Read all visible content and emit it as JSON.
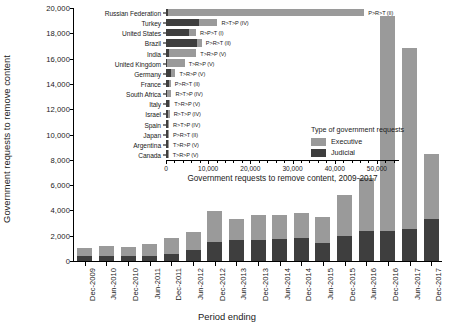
{
  "chart_data": [
    {
      "id": "main",
      "type": "bar",
      "stacked": true,
      "title": "",
      "xlabel": "Period ending",
      "ylabel": "Government requests to remove content",
      "ylim": [
        0,
        20000
      ],
      "ytick_values": [
        0,
        2000,
        4000,
        6000,
        8000,
        10000,
        12000,
        14000,
        16000,
        18000,
        20000
      ],
      "ytick_labels": [
        "0",
        "2,000",
        "4,000",
        "6,000",
        "8,000",
        "10,000",
        "12,000",
        "14,000",
        "16,000",
        "18,000",
        "20,000"
      ],
      "grid": false,
      "legend_position": "inset-center",
      "categories": [
        "Dec-2009",
        "Jun-2010",
        "Dec-2010",
        "Jun-2011",
        "Dec-2011",
        "Jun-2012",
        "Dec-2012",
        "Jun-2013",
        "Dec-2013",
        "Jun-2014",
        "Dec-2014",
        "Jun-2015",
        "Dec-2015",
        "Jun-2016",
        "Dec-2016",
        "Jun-2017",
        "Dec-2017"
      ],
      "series": [
        {
          "name": "Judicial",
          "color": "#3e3e3e",
          "values": [
            420,
            430,
            400,
            420,
            560,
            900,
            1500,
            1650,
            1700,
            1750,
            1800,
            1450,
            2000,
            2350,
            2400,
            2500,
            3300
          ]
        },
        {
          "name": "Executive",
          "color": "#9a9a9a",
          "values": [
            600,
            750,
            680,
            900,
            1250,
            1400,
            2450,
            1700,
            1900,
            1850,
            2000,
            2050,
            3250,
            4200,
            16950,
            14350,
            5200
          ]
        }
      ],
      "totals": [
        1020,
        1180,
        1080,
        1320,
        1810,
        2300,
        3950,
        3350,
        3600,
        3600,
        3800,
        3500,
        5250,
        6550,
        19350,
        16850,
        8500
      ]
    },
    {
      "id": "inset",
      "type": "bar",
      "orientation": "horizontal",
      "stacked": true,
      "title": "",
      "xlabel": "Government requests to remove content, 2009-2017",
      "ylabel": "",
      "xlim": [
        0,
        55000
      ],
      "xtick_values": [
        0,
        10000,
        20000,
        30000,
        40000,
        50000
      ],
      "xtick_labels": [
        "0",
        "10,000",
        "20,000",
        "30,000",
        "40,000",
        "50,000"
      ],
      "grid": false,
      "categories": [
        "Russian Federation",
        "Turkey",
        "United States",
        "Brazil",
        "India",
        "United Kingdom",
        "Germany",
        "France",
        "South Africa",
        "Italy",
        "Israel",
        "Spain",
        "Japan",
        "Argentina",
        "Canada"
      ],
      "annotations": [
        "P>R>T (II)",
        "R>T>P (IV)",
        "R>P>T (I)",
        "P>R>T (II)",
        "T>R>P (V)",
        "T>R>P (V)",
        "T>R>P (V)",
        "P>R>T (II)",
        "R>T>P (IV)",
        "T>R>P (V)",
        "R>T>P (IV)",
        "R>T>P (IV)",
        "P>R>T (II)",
        "T>R>P (V)",
        "T>R>P (V)"
      ],
      "series": [
        {
          "name": "Judicial",
          "color": "#3e3e3e",
          "values": [
            500,
            7900,
            5400,
            7400,
            700,
            320,
            1150,
            700,
            250,
            720,
            540,
            420,
            540,
            560,
            430
          ]
        },
        {
          "name": "Executive",
          "color": "#9a9a9a",
          "values": [
            46500,
            4300,
            1700,
            1100,
            6500,
            4100,
            1100,
            450,
            1050,
            300,
            320,
            300,
            150,
            170,
            200
          ]
        }
      ]
    }
  ],
  "legend": {
    "title": "Type of government requests",
    "entries": [
      {
        "label": "Executive",
        "color": "#9a9a9a"
      },
      {
        "label": "Judicial",
        "color": "#3e3e3e"
      }
    ]
  },
  "colors": {
    "executive": "#9a9a9a",
    "judicial": "#3e3e3e",
    "axis": "#000000",
    "background": "#ffffff"
  }
}
